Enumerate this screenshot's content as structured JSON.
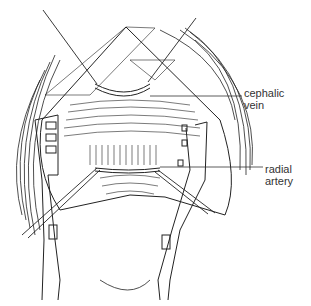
{
  "figure": {
    "type": "surgical line illustration",
    "colors": {
      "ink": "#222222",
      "background": "#ffffff"
    }
  },
  "labels": [
    {
      "id": "cephalic-vein",
      "text_line1": "cephalic",
      "text_line2": "vein"
    },
    {
      "id": "radial-artery",
      "text_line1": "radial",
      "text_line2": "artery"
    }
  ]
}
